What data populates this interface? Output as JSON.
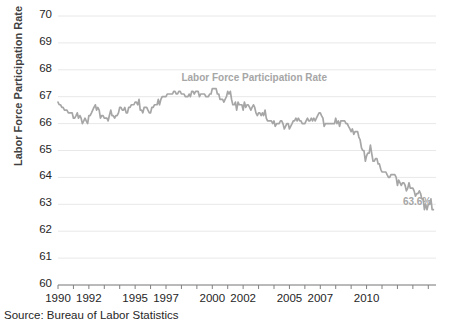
{
  "chart_data": {
    "type": "line",
    "title": "Labor Force Participation Rate",
    "series_label": "Labor Force Participation Rate",
    "xlabel": "",
    "ylabel": "Labor Force Participation Rate",
    "ylim": [
      60,
      70
    ],
    "ytick_step": 1,
    "ytick_labels": [
      "70",
      "69",
      "68",
      "67",
      "66",
      "65",
      "64",
      "63",
      "62",
      "61",
      "60"
    ],
    "xtick_labels": [
      "1990",
      "1992",
      "1995",
      "1997",
      "2000",
      "2002",
      "2005",
      "2007",
      "2010"
    ],
    "xtick_values": [
      1990,
      1992,
      1995,
      1997,
      2000,
      2002,
      2005,
      2007,
      2010
    ],
    "xlim": [
      1990,
      2014.5
    ],
    "grid": "horizontal",
    "legend": "none",
    "line_color": "#a6a6a6",
    "text_color": "#262626",
    "grid_color": "#e8e8e8",
    "axis_color": "#808080",
    "end_annotation": {
      "text": "63.6%",
      "x": 2014.3,
      "y": 63.6
    },
    "x": [
      1990.0,
      1990.08,
      1990.17,
      1990.25,
      1990.33,
      1990.42,
      1990.5,
      1990.58,
      1990.67,
      1990.75,
      1990.83,
      1990.92,
      1991.0,
      1991.08,
      1991.17,
      1991.25,
      1991.33,
      1991.42,
      1991.5,
      1991.58,
      1991.67,
      1991.75,
      1991.83,
      1991.92,
      1992.0,
      1992.08,
      1992.17,
      1992.25,
      1992.33,
      1992.42,
      1992.5,
      1992.58,
      1992.67,
      1992.75,
      1992.83,
      1992.92,
      1993.0,
      1993.08,
      1993.17,
      1993.25,
      1993.33,
      1993.42,
      1993.5,
      1993.58,
      1993.67,
      1993.75,
      1993.83,
      1993.92,
      1994.0,
      1994.08,
      1994.17,
      1994.25,
      1994.33,
      1994.42,
      1994.5,
      1994.58,
      1994.67,
      1994.75,
      1994.83,
      1994.92,
      1995.0,
      1995.08,
      1995.17,
      1995.25,
      1995.33,
      1995.42,
      1995.5,
      1995.58,
      1995.67,
      1995.75,
      1995.83,
      1995.92,
      1996.0,
      1996.08,
      1996.17,
      1996.25,
      1996.33,
      1996.42,
      1996.5,
      1996.58,
      1996.67,
      1996.75,
      1996.83,
      1996.92,
      1997.0,
      1997.08,
      1997.17,
      1997.25,
      1997.33,
      1997.42,
      1997.5,
      1997.58,
      1997.67,
      1997.75,
      1997.83,
      1997.92,
      1998.0,
      1998.08,
      1998.17,
      1998.25,
      1998.33,
      1998.42,
      1998.5,
      1998.58,
      1998.67,
      1998.75,
      1998.83,
      1998.92,
      1999.0,
      1999.08,
      1999.17,
      1999.25,
      1999.33,
      1999.42,
      1999.5,
      1999.58,
      1999.67,
      1999.75,
      1999.83,
      1999.92,
      2000.0,
      2000.08,
      2000.17,
      2000.25,
      2000.33,
      2000.42,
      2000.5,
      2000.58,
      2000.67,
      2000.75,
      2000.83,
      2000.92,
      2001.0,
      2001.08,
      2001.17,
      2001.25,
      2001.33,
      2001.42,
      2001.5,
      2001.58,
      2001.67,
      2001.75,
      2001.83,
      2001.92,
      2002.0,
      2002.08,
      2002.17,
      2002.25,
      2002.33,
      2002.42,
      2002.5,
      2002.58,
      2002.67,
      2002.75,
      2002.83,
      2002.92,
      2003.0,
      2003.08,
      2003.17,
      2003.25,
      2003.33,
      2003.42,
      2003.5,
      2003.58,
      2003.67,
      2003.75,
      2003.83,
      2003.92,
      2004.0,
      2004.08,
      2004.17,
      2004.25,
      2004.33,
      2004.42,
      2004.5,
      2004.58,
      2004.67,
      2004.75,
      2004.83,
      2004.92,
      2005.0,
      2005.08,
      2005.17,
      2005.25,
      2005.33,
      2005.42,
      2005.5,
      2005.58,
      2005.67,
      2005.75,
      2005.83,
      2005.92,
      2006.0,
      2006.08,
      2006.17,
      2006.25,
      2006.33,
      2006.42,
      2006.5,
      2006.58,
      2006.67,
      2006.75,
      2006.83,
      2006.92,
      2007.0,
      2007.08,
      2007.17,
      2007.25,
      2007.33,
      2007.42,
      2007.5,
      2007.58,
      2007.67,
      2007.75,
      2007.83,
      2007.92,
      2008.0,
      2008.08,
      2008.17,
      2008.25,
      2008.33,
      2008.42,
      2008.5,
      2008.58,
      2008.67,
      2008.75,
      2008.83,
      2008.92,
      2009.0,
      2009.08,
      2009.17,
      2009.25,
      2009.33,
      2009.42,
      2009.5,
      2009.58,
      2009.67,
      2009.75,
      2009.83,
      2009.92,
      2010.0,
      2010.08,
      2010.17,
      2010.25,
      2010.33,
      2010.42,
      2010.5,
      2010.58,
      2010.67,
      2010.75,
      2010.83,
      2010.92,
      2011.0,
      2011.08,
      2011.17,
      2011.25,
      2011.33,
      2011.42,
      2011.5,
      2011.58,
      2011.67,
      2011.75,
      2011.83,
      2011.92,
      2012.0,
      2012.08,
      2012.17,
      2012.25,
      2012.33,
      2012.42,
      2012.5,
      2012.58,
      2012.67,
      2012.75,
      2012.83,
      2012.92,
      2013.0,
      2013.08,
      2013.17,
      2013.25,
      2013.33,
      2013.42,
      2013.5,
      2013.58,
      2013.67,
      2013.75,
      2013.83,
      2013.92,
      2014.0,
      2014.08,
      2014.17,
      2014.25,
      2014.33
    ],
    "values": [
      66.8,
      66.7,
      66.7,
      66.6,
      66.6,
      66.5,
      66.5,
      66.5,
      66.4,
      66.4,
      66.4,
      66.4,
      66.2,
      66.2,
      66.3,
      66.4,
      66.2,
      66.3,
      66.2,
      66.0,
      66.1,
      66.2,
      66.1,
      66.0,
      66.3,
      66.3,
      66.4,
      66.5,
      66.6,
      66.7,
      66.5,
      66.6,
      66.5,
      66.2,
      66.3,
      66.3,
      66.2,
      66.2,
      66.2,
      66.1,
      66.3,
      66.5,
      66.3,
      66.3,
      66.2,
      66.3,
      66.3,
      66.4,
      66.6,
      66.6,
      66.5,
      66.5,
      66.6,
      66.4,
      66.4,
      66.6,
      66.6,
      66.7,
      66.7,
      66.7,
      66.8,
      66.8,
      66.7,
      66.9,
      66.5,
      66.5,
      66.4,
      66.6,
      66.6,
      66.6,
      66.5,
      66.4,
      66.4,
      66.6,
      66.6,
      66.7,
      66.7,
      66.7,
      66.9,
      66.7,
      66.9,
      67.0,
      67.0,
      67.0,
      67.0,
      67.1,
      67.1,
      67.1,
      67.1,
      67.1,
      67.2,
      67.2,
      67.1,
      67.1,
      67.2,
      67.2,
      67.1,
      67.1,
      67.1,
      67.0,
      67.0,
      67.0,
      67.1,
      67.0,
      67.2,
      67.2,
      67.1,
      67.2,
      67.2,
      67.2,
      67.0,
      67.1,
      67.1,
      67.1,
      67.1,
      67.0,
      67.0,
      67.0,
      67.1,
      67.1,
      67.3,
      67.3,
      67.3,
      67.3,
      67.1,
      67.1,
      66.9,
      66.9,
      66.9,
      66.8,
      66.9,
      67.0,
      67.2,
      67.1,
      67.2,
      66.9,
      66.7,
      66.7,
      66.8,
      66.5,
      66.8,
      66.7,
      66.7,
      66.7,
      66.5,
      66.8,
      66.6,
      66.7,
      66.7,
      66.6,
      66.5,
      66.6,
      66.7,
      66.6,
      66.4,
      66.3,
      66.4,
      66.4,
      66.3,
      66.4,
      66.3,
      66.5,
      66.2,
      66.1,
      66.1,
      66.1,
      66.1,
      66.0,
      66.1,
      65.9,
      66.0,
      66.0,
      66.0,
      66.1,
      66.1,
      66.0,
      65.8,
      65.9,
      66.0,
      66.0,
      65.8,
      65.9,
      66.0,
      66.1,
      66.1,
      66.2,
      66.1,
      66.2,
      66.1,
      66.1,
      66.0,
      66.0,
      66.0,
      66.1,
      66.2,
      66.1,
      66.1,
      66.2,
      66.1,
      66.2,
      66.1,
      66.2,
      66.3,
      66.4,
      66.4,
      66.3,
      66.2,
      65.9,
      66.0,
      66.0,
      66.0,
      66.0,
      66.0,
      66.0,
      66.0,
      66.0,
      66.2,
      66.0,
      66.1,
      65.9,
      66.1,
      66.1,
      66.1,
      66.1,
      66.0,
      66.0,
      65.9,
      65.8,
      65.7,
      65.8,
      65.6,
      65.7,
      65.7,
      65.7,
      65.5,
      65.4,
      65.1,
      65.0,
      65.0,
      64.6,
      64.8,
      64.9,
      64.9,
      65.2,
      64.9,
      64.6,
      64.6,
      64.7,
      64.7,
      64.5,
      64.5,
      64.3,
      64.2,
      64.2,
      64.2,
      64.2,
      64.1,
      64.0,
      64.0,
      64.1,
      64.1,
      64.1,
      64.1,
      64.0,
      63.7,
      63.9,
      63.8,
      63.7,
      63.8,
      63.8,
      63.7,
      63.5,
      63.6,
      63.8,
      63.6,
      63.6,
      63.6,
      63.5,
      63.3,
      63.4,
      63.4,
      63.5,
      63.4,
      63.2,
      63.2,
      62.8,
      63.0,
      62.8,
      63.0,
      63.0,
      63.2,
      62.8,
      62.8
    ]
  }
}
